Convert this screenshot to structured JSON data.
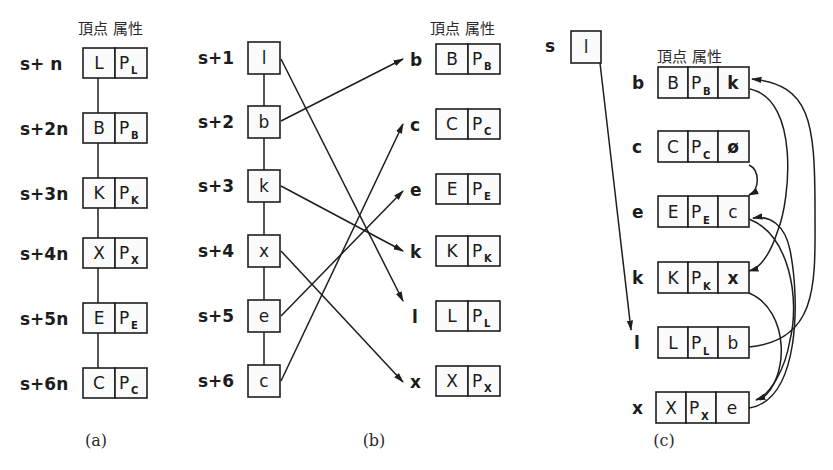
{
  "header_label": "頂点 属性",
  "panel_a": {
    "caption": "(a)",
    "rows": [
      {
        "addr": "s+ n",
        "vertex": "L",
        "attr": "P",
        "attr_sub": "L"
      },
      {
        "addr": "s+2n",
        "vertex": "B",
        "attr": "P",
        "attr_sub": "B"
      },
      {
        "addr": "s+3n",
        "vertex": "K",
        "attr": "P",
        "attr_sub": "K"
      },
      {
        "addr": "s+4n",
        "vertex": "X",
        "attr": "P",
        "attr_sub": "X"
      },
      {
        "addr": "s+5n",
        "vertex": "E",
        "attr": "P",
        "attr_sub": "E"
      },
      {
        "addr": "s+6n",
        "vertex": "C",
        "attr": "P",
        "attr_sub": "C"
      }
    ]
  },
  "panel_b": {
    "caption": "(b)",
    "left": [
      {
        "addr": "s+1",
        "ptr": "l"
      },
      {
        "addr": "s+2",
        "ptr": "b"
      },
      {
        "addr": "s+3",
        "ptr": "k"
      },
      {
        "addr": "s+4",
        "ptr": "x"
      },
      {
        "addr": "s+5",
        "ptr": "e"
      },
      {
        "addr": "s+6",
        "ptr": "c"
      }
    ],
    "right": [
      {
        "name": "b",
        "vertex": "B",
        "attr": "P",
        "attr_sub": "B"
      },
      {
        "name": "c",
        "vertex": "C",
        "attr": "P",
        "attr_sub": "C"
      },
      {
        "name": "e",
        "vertex": "E",
        "attr": "P",
        "attr_sub": "E"
      },
      {
        "name": "k",
        "vertex": "K",
        "attr": "P",
        "attr_sub": "K"
      },
      {
        "name": "l",
        "vertex": "L",
        "attr": "P",
        "attr_sub": "L"
      },
      {
        "name": "x",
        "vertex": "X",
        "attr": "P",
        "attr_sub": "X"
      }
    ],
    "arrows": [
      {
        "from": "s+1",
        "to": "l"
      },
      {
        "from": "s+2",
        "to": "b"
      },
      {
        "from": "s+3",
        "to": "k"
      },
      {
        "from": "s+4",
        "to": "x"
      },
      {
        "from": "s+5",
        "to": "e"
      },
      {
        "from": "s+6",
        "to": "c"
      }
    ]
  },
  "panel_c": {
    "caption": "(c)",
    "start": {
      "label": "s",
      "value": "l"
    },
    "rows": [
      {
        "name": "b",
        "vertex": "B",
        "attr": "P",
        "attr_sub": "B",
        "next": "k"
      },
      {
        "name": "c",
        "vertex": "C",
        "attr": "P",
        "attr_sub": "C",
        "next": "ø"
      },
      {
        "name": "e",
        "vertex": "E",
        "attr": "P",
        "attr_sub": "E",
        "next": "c"
      },
      {
        "name": "k",
        "vertex": "K",
        "attr": "P",
        "attr_sub": "K",
        "next": "x"
      },
      {
        "name": "l",
        "vertex": "L",
        "attr": "P",
        "attr_sub": "L",
        "next": "b"
      },
      {
        "name": "x",
        "vertex": "X",
        "attr": "P",
        "attr_sub": "X",
        "next": "e"
      }
    ]
  }
}
